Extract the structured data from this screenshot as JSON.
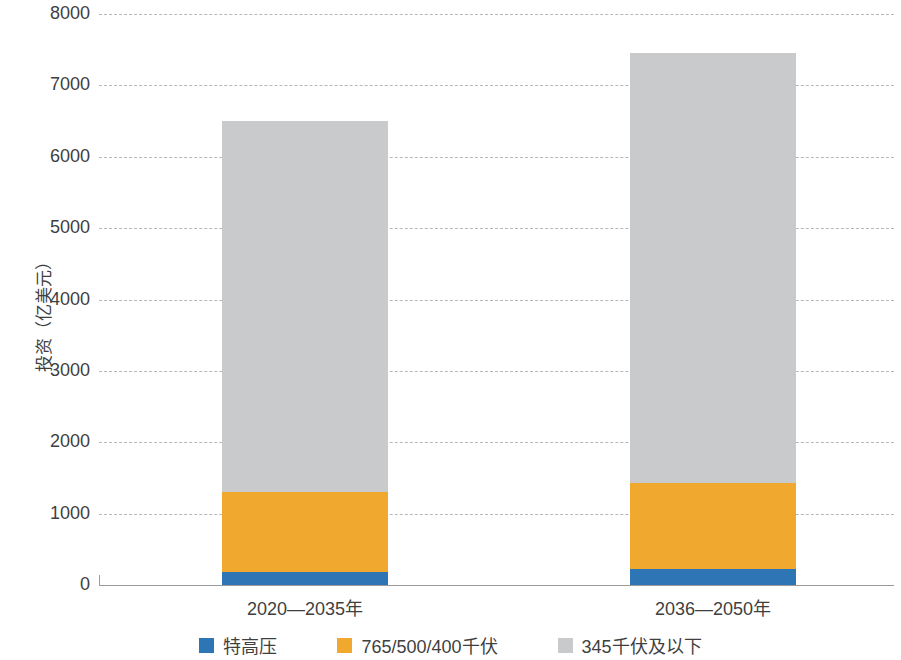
{
  "chart_data": {
    "type": "bar",
    "stacked": true,
    "title": "",
    "xlabel": "",
    "ylabel": "投资（亿美元）",
    "categories": [
      "2020—2035年",
      "2036—2050年"
    ],
    "series": [
      {
        "name": "特高压",
        "color": "#2e75b6",
        "values": [
          180,
          225
        ]
      },
      {
        "name": "765/500/400千伏",
        "color": "#f0a92e",
        "values": [
          1130,
          1205
        ]
      },
      {
        "name": "345千伏及以下",
        "color": "#c9cacb",
        "values": [
          5190,
          6020
        ]
      }
    ],
    "totals": [
      6500,
      7450
    ],
    "ylim": [
      0,
      8000
    ],
    "yticks": [
      0,
      1000,
      2000,
      3000,
      4000,
      5000,
      6000,
      7000,
      8000
    ],
    "ytick_labels": [
      "0",
      "1000",
      "2000",
      "3000",
      "4000",
      "5000",
      "6000",
      "7000",
      "8000"
    ],
    "grid": "horizontal-dashed",
    "legend_position": "bottom-center"
  },
  "axis": {
    "y_title": "投资（亿美元）"
  },
  "legend": {
    "items": [
      {
        "label": "特高压",
        "color": "#2e75b6"
      },
      {
        "label": "765/500/400千伏",
        "color": "#f0a92e"
      },
      {
        "label": "345千伏及以下",
        "color": "#c9cacb"
      }
    ]
  }
}
